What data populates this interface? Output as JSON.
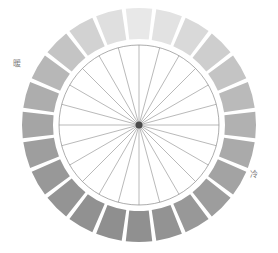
{
  "figure": {
    "name": "color-wheel",
    "background": "#ffffff"
  },
  "labels": {
    "warm": "暖",
    "cool": "冷",
    "label_color": "#7b7b7b"
  },
  "chart_data": {
    "type": "pie",
    "title": "",
    "subtitle": "",
    "xlabel": "",
    "ylabel": "",
    "annotations": [
      "暖",
      "冷"
    ],
    "legend_position": "none",
    "grid": false,
    "center_x": 139,
    "center_y": 125,
    "outer_radius": 117,
    "ring_inner_radius": 86,
    "inner_circle_radius": 80,
    "hub_radius": 3.5,
    "segment_count": 24,
    "segment_span_degrees": 15,
    "segment_gap_degrees": 2.0,
    "spoke_count": 24,
    "spoke_color": "#8a8a8a",
    "inner_circle_fill": "#ffffff",
    "hub_color": "#4a4a4a",
    "categories": [
      "0",
      "15",
      "30",
      "45",
      "60",
      "75",
      "90",
      "105",
      "120",
      "135",
      "150",
      "165",
      "180",
      "195",
      "210",
      "225",
      "240",
      "255",
      "270",
      "285",
      "300",
      "315",
      "330",
      "345"
    ],
    "values": [
      15,
      15,
      15,
      15,
      15,
      15,
      15,
      15,
      15,
      15,
      15,
      15,
      15,
      15,
      15,
      15,
      15,
      15,
      15,
      15,
      15,
      15,
      15,
      15
    ],
    "series": [
      {
        "name": "segment-greyscale",
        "values": [
          232,
          226,
          217,
          206,
          196,
          186,
          177,
          170,
          163,
          157,
          152,
          147,
          144,
          143,
          145,
          148,
          152,
          158,
          165,
          173,
          183,
          196,
          210,
          223
        ]
      }
    ],
    "segment_colors": [
      "#e8e8e8",
      "#e2e2e2",
      "#d9d9d9",
      "#cecece",
      "#c4c4c4",
      "#bababa",
      "#b1b1b1",
      "#aaaaaa",
      "#a3a3a3",
      "#9d9d9d",
      "#989898",
      "#939393",
      "#909090",
      "#8f8f8f",
      "#919191",
      "#949494",
      "#989898",
      "#9e9e9e",
      "#a5a5a5",
      "#adadad",
      "#b7b7b7",
      "#c4c4c4",
      "#d2d2d2",
      "#dfdfdf"
    ],
    "segment_start_angles_deg": [
      -97.5,
      -82.5,
      -67.5,
      -52.5,
      -37.5,
      -22.5,
      -7.5,
      7.5,
      22.5,
      37.5,
      52.5,
      67.5,
      82.5,
      97.5,
      112.5,
      127.5,
      142.5,
      157.5,
      172.5,
      187.5,
      202.5,
      217.5,
      232.5,
      247.5
    ],
    "warm_side": "left",
    "cool_side": "right"
  }
}
